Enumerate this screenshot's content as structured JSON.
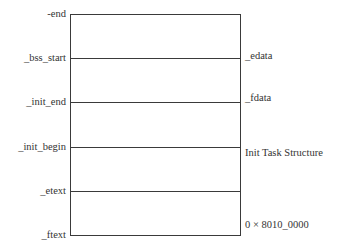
{
  "diagram": {
    "type": "memory-layout",
    "left_labels": [
      "-end",
      "_bss_start",
      "_init_end",
      "_init_begin",
      "_etext",
      "_ftext"
    ],
    "right_labels": [
      "_edata",
      "_fdata",
      "Init Task Structure",
      "0 × 8010_0000"
    ],
    "colors": {
      "line": "#3a3a3a",
      "text": "#333333",
      "background": "#ffffff"
    }
  }
}
